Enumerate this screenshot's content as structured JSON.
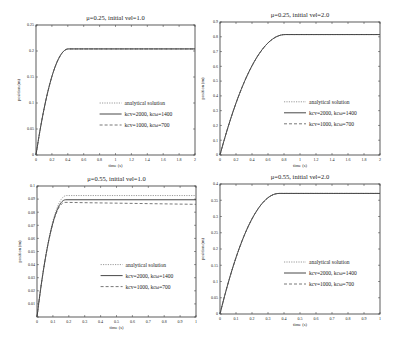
{
  "chart_data": [
    {
      "type": "line",
      "title": "μ=0.25, initial vel=1.0",
      "xlabel": "time (s)",
      "ylabel": "position (m)",
      "xlim": [
        0,
        2
      ],
      "ylim": [
        0,
        0.25
      ],
      "xticks": [
        "0",
        "0.2",
        "0.4",
        "0.6",
        "0.8",
        "1",
        "1.2",
        "1.4",
        "1.6",
        "1.8",
        "2"
      ],
      "yticks": [
        "0",
        "0.05",
        "0.1",
        "0.15",
        "0.2",
        "0.25"
      ],
      "grid": false,
      "legend_position": "center-right",
      "frame": {
        "x": 36,
        "y": 25,
        "w": 159,
        "h": 130
      },
      "series": [
        {
          "name": "analytical solution",
          "style": "dotted",
          "stop_time": 0.408,
          "plateau": 0.204
        },
        {
          "name": "kcv=2000, kcω=1400",
          "style": "solid",
          "stop_time": 0.408,
          "plateau": 0.204
        },
        {
          "name": "kcv=1000, kcω=700",
          "style": "dashed",
          "stop_time": 0.408,
          "plateau": 0.204
        }
      ]
    },
    {
      "type": "line",
      "title": "μ=0.25, initial vel=2.0",
      "xlabel": "time (s)",
      "ylabel": "position (m)",
      "xlim": [
        0,
        2
      ],
      "ylim": [
        0,
        0.9
      ],
      "xticks": [
        "0",
        "0.2",
        "0.4",
        "0.6",
        "0.8",
        "1",
        "1.2",
        "1.4",
        "1.6",
        "1.8",
        "2"
      ],
      "yticks": [
        "0",
        "0.1",
        "0.2",
        "0.3",
        "0.4",
        "0.5",
        "0.6",
        "0.7",
        "0.8",
        "0.9"
      ],
      "grid": false,
      "legend_position": "center-right",
      "frame": {
        "x": 220,
        "y": 22,
        "w": 160,
        "h": 133
      },
      "series": [
        {
          "name": "analytical solution",
          "style": "dotted",
          "stop_time": 0.815,
          "plateau": 0.815
        },
        {
          "name": "kcv=2000, kcω=1400",
          "style": "solid",
          "stop_time": 0.815,
          "plateau": 0.815
        },
        {
          "name": "kcv=1000, kcω=700",
          "style": "dashed",
          "stop_time": 0.815,
          "plateau": 0.815
        }
      ]
    },
    {
      "type": "line",
      "title": "μ=0.55, initial vel=1.0",
      "xlabel": "time (s)",
      "ylabel": "position (m)",
      "xlim": [
        0,
        1
      ],
      "ylim": [
        0,
        0.1
      ],
      "xticks": [
        "0",
        "0.1",
        "0.2",
        "0.3",
        "0.4",
        "0.5",
        "0.6",
        "0.7",
        "0.8",
        "0.9",
        "1"
      ],
      "yticks": [
        "",
        "0.01",
        "0.02",
        "0.03",
        "0.04",
        "0.05",
        "0.06",
        "0.07",
        "0.08",
        "0.09",
        "0.1"
      ],
      "grid": false,
      "legend_position": "center-right",
      "frame": {
        "x": 37,
        "y": 186,
        "w": 159,
        "h": 131
      },
      "series": [
        {
          "name": "analytical solution",
          "style": "dotted",
          "stop_time": 0.185,
          "plateau": 0.0927
        },
        {
          "name": "kcv=2000, kcω=1400",
          "style": "solid",
          "stop_time": 0.18,
          "plateau": 0.0895
        },
        {
          "name": "kcv=1000, kcω=700",
          "style": "dashed",
          "stop_time": 0.175,
          "plateau": 0.0875,
          "final": 0.086
        }
      ]
    },
    {
      "type": "line",
      "title": "μ=0.55, initial vel=2.0",
      "xlabel": "time (s)",
      "ylabel": "position (m)",
      "xlim": [
        0,
        1
      ],
      "ylim": [
        0,
        0.4
      ],
      "xticks": [
        "0",
        "0.1",
        "0.2",
        "0.3",
        "0.4",
        "0.5",
        "0.6",
        "0.7",
        "0.8",
        "0.9",
        "1"
      ],
      "yticks": [
        "0",
        "0.05",
        "0.1",
        "0.15",
        "0.2",
        "0.25",
        "0.3",
        "0.35",
        "0.4"
      ],
      "grid": false,
      "legend_position": "center-right",
      "frame": {
        "x": 220,
        "y": 184,
        "w": 160,
        "h": 130
      },
      "series": [
        {
          "name": "analytical solution",
          "style": "dotted",
          "stop_time": 0.37,
          "plateau": 0.371
        },
        {
          "name": "kcv=2000, kcω=1400",
          "style": "solid",
          "stop_time": 0.37,
          "plateau": 0.371
        },
        {
          "name": "kcv=1000, kcω=700",
          "style": "dashed",
          "stop_time": 0.37,
          "plateau": 0.371
        }
      ]
    }
  ],
  "legend_labels": {
    "analytical": "analytical solution",
    "high_k": "kcv=2000, kcω=1400",
    "low_k": "kcv=1000, kcω=700"
  },
  "colors": {
    "analytical": "#9a9a9a",
    "high_k": "#333333",
    "low_k": "#555555",
    "frame": "#333333"
  }
}
